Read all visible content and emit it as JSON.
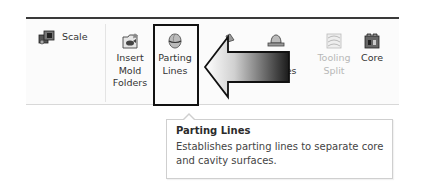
{
  "ribbon": {
    "scale": {
      "label": "Scale",
      "icon": "scale-icon"
    },
    "buttons": [
      {
        "label": "Insert\nMold\nFolders",
        "icon": "insert-mold-folders-icon",
        "enabled": true
      },
      {
        "label": "Parting\nLines",
        "icon": "parting-lines-icon",
        "enabled": true,
        "highlighted": true
      },
      {
        "label": "Shut-off\nSurfaces",
        "visible_fragment": "S  faces",
        "icon": "shut-off-surfaces-icon",
        "enabled": true
      },
      {
        "label": "Parting\nSurfaces",
        "visible_fragment": "ng\nSurfaces",
        "icon": "parting-surfaces-icon",
        "enabled": true
      },
      {
        "label": "Tooling\nSplit",
        "icon": "tooling-split-icon",
        "enabled": false
      },
      {
        "label": "Core",
        "icon": "core-icon",
        "enabled": true
      }
    ]
  },
  "annotation": {
    "type": "arrow",
    "points_to": "Parting Lines",
    "colors": {
      "outline": "#111111",
      "gradient_start": "#ffffff",
      "gradient_end": "#1a1a1a"
    }
  },
  "tooltip": {
    "title": "Parting Lines",
    "description": "Establishes parting lines to separate core and cavity surfaces."
  }
}
